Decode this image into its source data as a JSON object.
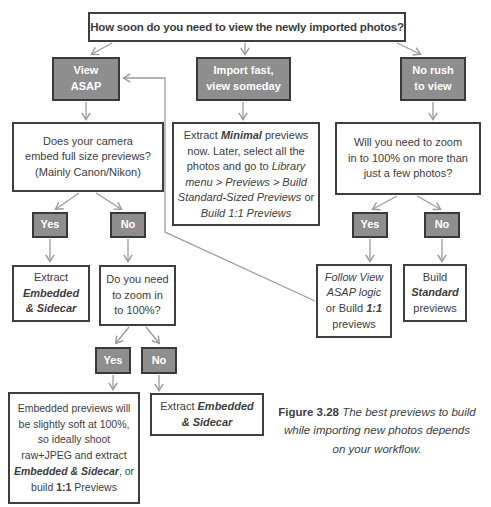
{
  "figure": {
    "caption_label": "Figure 3.28",
    "caption_text": " The best previews to build while importing new photos depends on your workflow."
  },
  "labels": {
    "yes": "Yes",
    "no": "No"
  },
  "nodes": {
    "root": {
      "text": "How soon do you need to view the newly imported photos?"
    },
    "view_asap": {
      "line1": "View",
      "line2": "ASAP"
    },
    "import_fast": {
      "line1": "Import fast,",
      "line2": "view someday"
    },
    "no_rush": {
      "line1": "No rush",
      "line2": "to view"
    },
    "camera_q": {
      "line1": "Does your camera",
      "line2": "embed full size previews?",
      "line3": "(Mainly Canon/Nikon)"
    },
    "extract_minimal": {
      "s1": "Extract ",
      "s2": "Minimal",
      "s3": " previews now. Later, select all the photos and go to ",
      "s4": "Library menu > Previews > Build Standard-Sized Previews",
      "s5": " or ",
      "s6": "Build 1:1 Previews"
    },
    "zoom_many_q": {
      "line1": "Will you need to zoom",
      "line2": "in to 100% on more than",
      "line3": "just a few photos?"
    },
    "extract_embedded_sidecar_left": {
      "line1": "Extract",
      "line2": "Embedded",
      "line3": "& Sidecar"
    },
    "zoom_100_q": {
      "line1": "Do you need",
      "line2": "to zoom in",
      "line3": "to 100%?"
    },
    "follow_view_asap": {
      "s1": "Follow View ASAP logic",
      "s2": " or Build ",
      "s3": "1:1",
      "s4": " previews"
    },
    "build_standard": {
      "s1": "Build ",
      "s2": "Standard",
      "s3": " previews"
    },
    "embedded_soft": {
      "s1": "Embedded previews will be slightly soft at 100%, so ideally shoot raw+JPEG and extract ",
      "s2": "Embedded & Sidecar",
      "s3": ", or build ",
      "s4": "1:1",
      "s5": " Previews"
    },
    "extract_embedded_sidecar_bottom": {
      "s1": "Extract ",
      "s2": "Embedded & Sidecar"
    }
  },
  "colors": {
    "gray_node_fill": "#8e8e8e",
    "node_border": "#3e3e3e",
    "connector": "#9b9b9b",
    "text": "#3d3d3d",
    "gray_node_text": "#ffffff"
  }
}
